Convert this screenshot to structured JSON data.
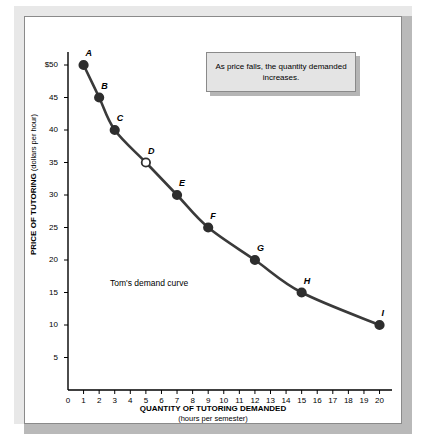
{
  "chart_data": {
    "type": "line",
    "title": "",
    "xlabel": "QUANTITY OF TUTORING DEMANDED",
    "xlabel_sub": "(hours per semester)",
    "ylabel": "PRICE OF TUTORING",
    "ylabel_sub": "(dollars per hour)",
    "xlim": [
      0,
      20.8
    ],
    "ylim": [
      0,
      52
    ],
    "xticks": [
      "0",
      "1",
      "2",
      "3",
      "4",
      "5",
      "6",
      "7",
      "8",
      "9",
      "10",
      "11",
      "12",
      "13",
      "14",
      "15",
      "16",
      "17",
      "18",
      "19",
      "20"
    ],
    "yticks": [
      "5",
      "10",
      "15",
      "20",
      "25",
      "30",
      "35",
      "40",
      "45",
      "$50"
    ],
    "grid": false,
    "legend": "none",
    "series_name": "Tom's demand curve",
    "points": [
      {
        "label": "A",
        "x": 1,
        "y": 50,
        "open": false
      },
      {
        "label": "B",
        "x": 2,
        "y": 45,
        "open": false
      },
      {
        "label": "C",
        "x": 3,
        "y": 40,
        "open": false
      },
      {
        "label": "D",
        "x": 5,
        "y": 35,
        "open": true
      },
      {
        "label": "E",
        "x": 7,
        "y": 30,
        "open": false
      },
      {
        "label": "F",
        "x": 9,
        "y": 25,
        "open": false
      },
      {
        "label": "G",
        "x": 12,
        "y": 20,
        "open": false
      },
      {
        "label": "H",
        "x": 15,
        "y": 15,
        "open": false
      },
      {
        "label": "I",
        "x": 20,
        "y": 10,
        "open": false
      }
    ],
    "annotation": "As price falls, the quantity demanded increases.",
    "curve_annotation": "Tom's demand curve",
    "colors": {
      "curve": "#3a3a3a",
      "axis": "#000000",
      "callout_bg": "#e4e4e4",
      "box_bevel": "#e8e8e8",
      "box_shadow": "#b9b9b9"
    }
  }
}
